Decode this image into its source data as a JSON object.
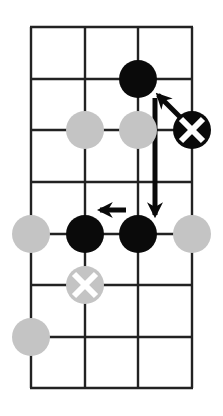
{
  "board": {
    "columns": 4,
    "rows": 8,
    "x_lines": [
      31,
      85,
      138,
      192
    ],
    "y_lines": [
      27,
      79,
      130,
      182,
      234,
      285,
      337,
      388
    ],
    "line_color": "#222222",
    "background": "#ffffff"
  },
  "stone_radius": 19,
  "colors": {
    "black": "#0a0a0a",
    "gray": "#c4c4c4",
    "mark": "#ffffff"
  },
  "stones": [
    {
      "col": 2,
      "row": 1,
      "color": "black",
      "marked": false
    },
    {
      "col": 1,
      "row": 2,
      "color": "gray",
      "marked": false
    },
    {
      "col": 2,
      "row": 2,
      "color": "gray",
      "marked": false
    },
    {
      "col": 3,
      "row": 2,
      "color": "black",
      "marked": true
    },
    {
      "col": 0,
      "row": 4,
      "color": "gray",
      "marked": false
    },
    {
      "col": 1,
      "row": 4,
      "color": "black",
      "marked": false
    },
    {
      "col": 2,
      "row": 4,
      "color": "black",
      "marked": false
    },
    {
      "col": 3,
      "row": 4,
      "color": "gray",
      "marked": false
    },
    {
      "col": 1,
      "row": 5,
      "color": "gray",
      "marked": true
    },
    {
      "col": 0,
      "row": 6,
      "color": "gray",
      "marked": false
    }
  ],
  "arrows": [
    {
      "name": "arrow-x-to-top-black",
      "x1": 180,
      "y1": 117,
      "x2": 158,
      "y2": 95
    },
    {
      "name": "arrow-down",
      "x1": 155,
      "y1": 98,
      "x2": 155,
      "y2": 215
    },
    {
      "name": "arrow-left",
      "x1": 126,
      "y1": 210,
      "x2": 100,
      "y2": 210
    }
  ]
}
